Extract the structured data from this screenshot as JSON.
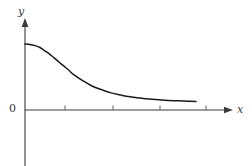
{
  "figure": {
    "kind": "coordinate-plot",
    "background_color": "#ffffff",
    "ink_color": "#3a3a3a",
    "curve_color": "#1a1a1a"
  },
  "labels": {
    "y_axis": "y",
    "x_axis": "x",
    "origin": "0"
  },
  "chart_data": {
    "type": "line",
    "title": "",
    "xlabel": "x",
    "ylabel": "y",
    "origin_label": "0",
    "grid": false,
    "legend": null,
    "axis_arrows": {
      "x": true,
      "y": true
    },
    "axis_pixels": {
      "y_axis_x": 25,
      "x_axis_y": 110,
      "y_axis_top": 20,
      "y_axis_bottom": 166,
      "x_axis_right": 232
    },
    "xlim": [
      0,
      4.4
    ],
    "ylim": [
      0,
      1.15
    ],
    "xticks": [
      1,
      2,
      3,
      4
    ],
    "xtick_labels": [
      "",
      "",
      "",
      ""
    ],
    "xtick_pixels": [
      65,
      113,
      160,
      206
    ],
    "yticks": [],
    "ytick_labels": [],
    "annotations": [],
    "series": [
      {
        "name": "decay-curve",
        "description": "bell-shaped curve with maximum on the y-axis decaying asymptotically to the x-axis",
        "x": [
          0.0,
          0.1,
          0.2,
          0.3,
          0.4,
          0.5,
          0.6,
          0.7,
          0.8,
          0.9,
          1.0,
          1.2,
          1.4,
          1.6,
          1.8,
          2.0,
          2.2,
          2.4,
          2.6,
          2.8,
          3.0,
          3.2,
          3.4,
          3.6
        ],
        "y": [
          1.0,
          0.995,
          0.975,
          0.942,
          0.895,
          0.835,
          0.765,
          0.692,
          0.618,
          0.548,
          0.482,
          0.368,
          0.278,
          0.21,
          0.158,
          0.12,
          0.091,
          0.069,
          0.052,
          0.039,
          0.029,
          0.021,
          0.014,
          0.008
        ],
        "pixel_points": [
          [
            25,
            44
          ],
          [
            30,
            44.4
          ],
          [
            35,
            45.6
          ],
          [
            40,
            47.5
          ],
          [
            44,
            50.3
          ],
          [
            49,
            53.7
          ],
          [
            54,
            57.8
          ],
          [
            59,
            62.0
          ],
          [
            64,
            66.2
          ],
          [
            69,
            70.3
          ],
          [
            73,
            74.1
          ],
          [
            83,
            80.8
          ],
          [
            92,
            86.0
          ],
          [
            102,
            89.9
          ],
          [
            111,
            92.9
          ],
          [
            121,
            95.1
          ],
          [
            130,
            96.8
          ],
          [
            140,
            98.1
          ],
          [
            149,
            99.1
          ],
          [
            159,
            99.8
          ],
          [
            168,
            100.4
          ],
          [
            178,
            100.8
          ],
          [
            187,
            101.2
          ],
          [
            196,
            101.6
          ]
        ]
      }
    ]
  }
}
